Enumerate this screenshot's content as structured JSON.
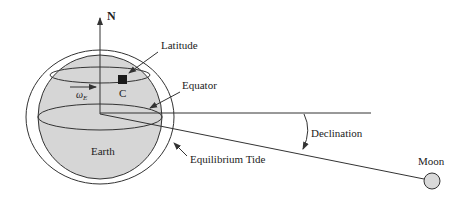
{
  "diagram": {
    "labels": {
      "north": "N",
      "latitude": "Latitude",
      "point": "C",
      "rotation_symbol": "ω",
      "rotation_subscript": "E",
      "equator": "Equator",
      "declination": "Declination",
      "earth": "Earth",
      "equilibrium_tide": "Equilibrium Tide",
      "moon": "Moon"
    },
    "colors": {
      "earth_fill": "#d6d6d6",
      "moon_fill": "#d9d9d9",
      "line": "#333333",
      "marker": "#1a1a1a"
    }
  }
}
